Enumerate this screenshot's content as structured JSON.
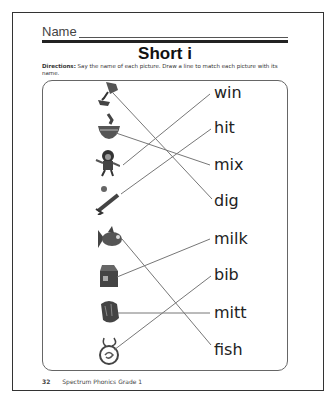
{
  "header": {
    "name_label": "Name",
    "title": "Short i",
    "directions_label": "Directions:",
    "directions_text": "Say the name of each picture. Draw a line to match each picture with its name."
  },
  "pictures": [
    {
      "id": "pic-1",
      "icon": "wind-mill-icon",
      "description": "hand digging with trowel"
    },
    {
      "id": "pic-2",
      "icon": "bowl-mix-icon",
      "description": "mixing bowl"
    },
    {
      "id": "pic-3",
      "icon": "winner-icon",
      "description": "child jumping"
    },
    {
      "id": "pic-4",
      "icon": "bat-hit-icon",
      "description": "bat hitting ball"
    },
    {
      "id": "pic-5",
      "icon": "fish-icon",
      "description": "fish"
    },
    {
      "id": "pic-6",
      "icon": "milk-carton-icon",
      "description": "milk carton"
    },
    {
      "id": "pic-7",
      "icon": "mitt-icon",
      "description": "baseball mitt"
    },
    {
      "id": "pic-8",
      "icon": "bib-icon",
      "description": "bib"
    }
  ],
  "words": [
    "win",
    "hit",
    "mix",
    "dig",
    "milk",
    "bib",
    "mitt",
    "fish"
  ],
  "matches": [
    {
      "picture": 1,
      "word": "dig"
    },
    {
      "picture": 2,
      "word": "mix"
    },
    {
      "picture": 3,
      "word": "win"
    },
    {
      "picture": 4,
      "word": "hit"
    },
    {
      "picture": 5,
      "word": "fish"
    },
    {
      "picture": 6,
      "word": "milk"
    },
    {
      "picture": 7,
      "word": "mitt"
    },
    {
      "picture": 8,
      "word": "bib"
    }
  ],
  "footer": {
    "page_number": "32",
    "book_title": "Spectrum Phonics Grade 1"
  }
}
